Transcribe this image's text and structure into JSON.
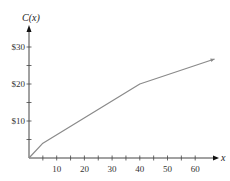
{
  "chart_data": {
    "type": "line",
    "title": "",
    "xlabel": "x",
    "ylabel": "C(x)",
    "xlim": [
      0,
      67
    ],
    "ylim": [
      0,
      35
    ],
    "x_ticks_major": [
      10,
      20,
      30,
      40,
      50,
      60
    ],
    "x_tick_labels": [
      "10",
      "20",
      "30",
      "40",
      "50",
      "60"
    ],
    "x_ticks_minor_step": 5,
    "y_ticks_major": [
      10,
      20,
      30
    ],
    "y_tick_labels": [
      "$10",
      "$20",
      "$30"
    ],
    "y_ticks_minor_step": 5,
    "grid": false,
    "legend": null,
    "series": [
      {
        "name": "C(x)",
        "color": "#8a8a8a",
        "points": [
          [
            0,
            0
          ],
          [
            5,
            4
          ],
          [
            40,
            20
          ],
          [
            67,
            26.75
          ]
        ],
        "end_arrow": true
      }
    ]
  },
  "colors": {
    "axis": "#444444",
    "line": "#8a8a8a"
  }
}
